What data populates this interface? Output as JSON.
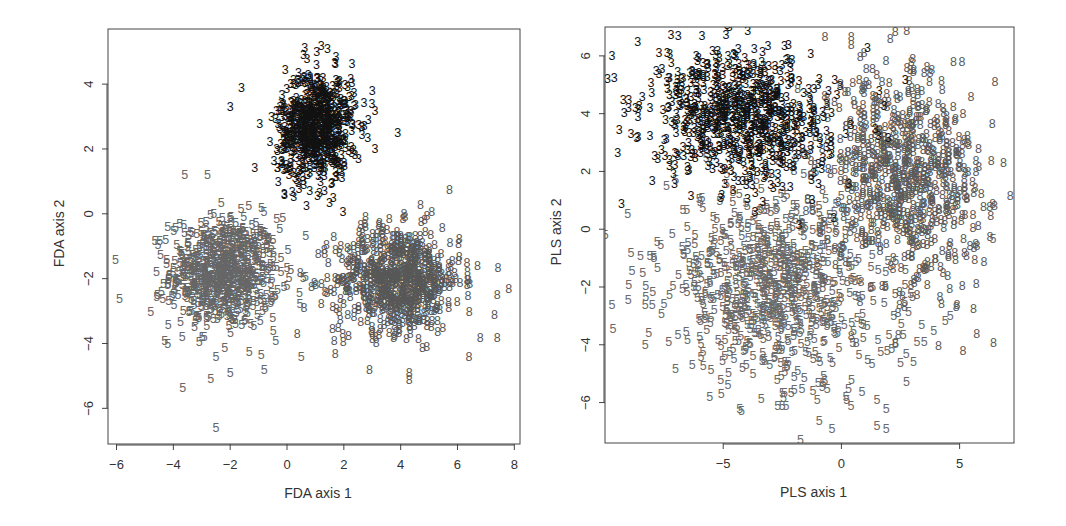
{
  "chart_data": [
    {
      "type": "scatter",
      "panel": "left",
      "title": "",
      "xlabel": "FDA axis 1",
      "ylabel": "FDA axis 2",
      "xlim": [
        -6.3,
        8.2
      ],
      "ylim": [
        -7.1,
        5.7
      ],
      "xticks": [
        -6,
        -4,
        -2,
        0,
        2,
        4,
        6,
        8
      ],
      "yticks": [
        -6,
        -4,
        -2,
        0,
        2,
        4
      ],
      "box": {
        "left": 108,
        "right": 520,
        "top": 29,
        "bottom": 444
      },
      "grid": false,
      "legend": null,
      "series": [
        {
          "name": "3",
          "color": "#111111",
          "n": 700,
          "center": [
            1.0,
            2.7
          ],
          "sd": [
            0.65,
            0.85
          ],
          "rot": -0.15
        },
        {
          "name": "5",
          "color": "#666666",
          "n": 700,
          "center": [
            -2.2,
            -1.8
          ],
          "sd": [
            0.95,
            0.85
          ],
          "rot": 0.0
        },
        {
          "name": "8",
          "color": "#575757",
          "n": 700,
          "center": [
            3.9,
            -2.0
          ],
          "sd": [
            1.1,
            0.8
          ],
          "rot": 0.0
        }
      ],
      "outliers": [
        {
          "label": "3",
          "x": 1.2,
          "y": 5.2
        },
        {
          "label": "3",
          "x": 1.05,
          "y": 5.0
        },
        {
          "label": "3",
          "x": -1.6,
          "y": 3.9
        },
        {
          "label": "3",
          "x": -2.0,
          "y": 3.3
        },
        {
          "label": "3",
          "x": 3.9,
          "y": 2.5
        },
        {
          "label": "3",
          "x": 3.0,
          "y": 3.8
        },
        {
          "label": "3",
          "x": 3.1,
          "y": 3.2
        },
        {
          "label": "3",
          "x": 3.1,
          "y": 2.0
        },
        {
          "label": "5",
          "x": -5.9,
          "y": -2.6
        },
        {
          "label": "5",
          "x": -4.8,
          "y": -3.0
        },
        {
          "label": "5",
          "x": -4.3,
          "y": -3.9
        },
        {
          "label": "5",
          "x": -4.2,
          "y": -4.0
        },
        {
          "label": "5",
          "x": -3.6,
          "y": 1.2
        },
        {
          "label": "5",
          "x": -2.8,
          "y": 1.2
        },
        {
          "label": "5",
          "x": -2.5,
          "y": -4.4
        },
        {
          "label": "5",
          "x": -2.0,
          "y": -4.9
        },
        {
          "label": "5",
          "x": -0.8,
          "y": -4.8
        },
        {
          "label": "5",
          "x": 0.5,
          "y": -4.4
        },
        {
          "label": "5",
          "x": -2.5,
          "y": -6.6
        },
        {
          "label": "5",
          "x": 0.0,
          "y": -2.2
        },
        {
          "label": "5",
          "x": -0.5,
          "y": -3.2
        },
        {
          "label": "5",
          "x": -0.4,
          "y": -3.9
        },
        {
          "label": "8",
          "x": 6.7,
          "y": -1.6
        },
        {
          "label": "8",
          "x": 7.8,
          "y": -2.3
        },
        {
          "label": "8",
          "x": 7.4,
          "y": -2.5
        },
        {
          "label": "8",
          "x": 7.3,
          "y": -3.1
        },
        {
          "label": "8",
          "x": 6.8,
          "y": -3.8
        },
        {
          "label": "8",
          "x": 7.4,
          "y": -3.8
        },
        {
          "label": "8",
          "x": 6.4,
          "y": -4.4
        },
        {
          "label": "8",
          "x": 4.3,
          "y": -5.1
        },
        {
          "label": "8",
          "x": 4.3,
          "y": -4.9
        },
        {
          "label": "8",
          "x": 2.9,
          "y": -4.8
        },
        {
          "label": "8",
          "x": 1.7,
          "y": -4.3
        },
        {
          "label": "8",
          "x": 0.6,
          "y": -2.9
        },
        {
          "label": "8",
          "x": 4.7,
          "y": 0.3
        },
        {
          "label": "8",
          "x": 1.8,
          "y": -3.5
        }
      ]
    },
    {
      "type": "scatter",
      "panel": "right",
      "title": "",
      "xlabel": "PLS axis 1",
      "ylabel": "PLS axis 2",
      "xlim": [
        -10.0,
        7.3
      ],
      "ylim": [
        -7.4,
        7.0
      ],
      "xticks": [
        -5,
        0,
        5
      ],
      "yticks": [
        -6,
        -4,
        -2,
        0,
        2,
        4,
        6
      ],
      "box": {
        "left": 605,
        "right": 1014,
        "top": 27,
        "bottom": 443
      },
      "grid": false,
      "legend": null,
      "series": [
        {
          "name": "3",
          "color": "#111111",
          "n": 750,
          "center": [
            -4.2,
            3.9
          ],
          "sd": [
            1.9,
            1.1
          ],
          "rot": -0.18
        },
        {
          "name": "5",
          "color": "#6a6a6a",
          "n": 800,
          "center": [
            -2.8,
            -2.0
          ],
          "sd": [
            2.4,
            1.6
          ],
          "rot": -0.2
        },
        {
          "name": "8",
          "color": "#5a5a5a",
          "n": 750,
          "center": [
            2.6,
            1.8
          ],
          "sd": [
            1.6,
            1.9
          ],
          "rot": 0.35
        }
      ],
      "outliers": [
        {
          "label": "3",
          "x": -9.7,
          "y": 6.0
        },
        {
          "label": "3",
          "x": -9.0,
          "y": 4.5
        },
        {
          "label": "3",
          "x": -8.6,
          "y": 3.9
        },
        {
          "label": "3",
          "x": -8.9,
          "y": 3.3
        },
        {
          "label": "3",
          "x": -8.6,
          "y": 3.2
        },
        {
          "label": "3",
          "x": -9.3,
          "y": 0.9
        },
        {
          "label": "3",
          "x": -8.0,
          "y": 1.7
        },
        {
          "label": "3",
          "x": -6.9,
          "y": 6.7
        },
        {
          "label": "3",
          "x": -5.9,
          "y": 6.7
        },
        {
          "label": "3",
          "x": 1.1,
          "y": 6.3
        },
        {
          "label": "3",
          "x": 2.7,
          "y": 5.2
        },
        {
          "label": "3",
          "x": 1.6,
          "y": 4.8
        },
        {
          "label": "3",
          "x": 1.8,
          "y": 4.3
        },
        {
          "label": "3",
          "x": -1.3,
          "y": 6.1
        },
        {
          "label": "8",
          "x": 6.5,
          "y": 5.1
        },
        {
          "label": "8",
          "x": 5.1,
          "y": 5.8
        },
        {
          "label": "8",
          "x": 5.2,
          "y": -0.8
        },
        {
          "label": "8",
          "x": 4.3,
          "y": -1.5
        },
        {
          "label": "8",
          "x": 5.8,
          "y": 2.8
        },
        {
          "label": "8",
          "x": 5.3,
          "y": 1.1
        },
        {
          "label": "5",
          "x": -9.7,
          "y": -2.6
        },
        {
          "label": "5",
          "x": -8.3,
          "y": -2.6
        },
        {
          "label": "5",
          "x": -8.3,
          "y": -4.0
        },
        {
          "label": "5",
          "x": -7.3,
          "y": -3.9
        },
        {
          "label": "5",
          "x": -9.0,
          "y": -1.9
        },
        {
          "label": "5",
          "x": -8.9,
          "y": -0.8
        },
        {
          "label": "5",
          "x": -8.5,
          "y": -0.9
        },
        {
          "label": "5",
          "x": -8.1,
          "y": -0.9
        },
        {
          "label": "5",
          "x": -4.3,
          "y": -6.2
        },
        {
          "label": "5",
          "x": -2.5,
          "y": -6.1
        },
        {
          "label": "5",
          "x": 0.4,
          "y": -6.1
        },
        {
          "label": "5",
          "x": 1.5,
          "y": -5.9
        },
        {
          "label": "5",
          "x": 1.9,
          "y": -6.2
        },
        {
          "label": "5",
          "x": -0.4,
          "y": -6.9
        },
        {
          "label": "5",
          "x": 1.5,
          "y": -6.8
        },
        {
          "label": "5",
          "x": 1.9,
          "y": -6.9
        },
        {
          "label": "5",
          "x": 0.3,
          "y": -5.5
        },
        {
          "label": "5",
          "x": -0.6,
          "y": -5.5
        },
        {
          "label": "5",
          "x": 4.6,
          "y": -3.0
        },
        {
          "label": "5",
          "x": 3.9,
          "y": -3.5
        },
        {
          "label": "5",
          "x": 3.4,
          "y": -3.3
        },
        {
          "label": "5",
          "x": 3.2,
          "y": -3.9
        },
        {
          "label": "5",
          "x": 3.5,
          "y": -3.9
        },
        {
          "label": "5",
          "x": 2.5,
          "y": -4.6
        },
        {
          "label": "5",
          "x": -5.1,
          "y": -5.2
        }
      ]
    }
  ]
}
